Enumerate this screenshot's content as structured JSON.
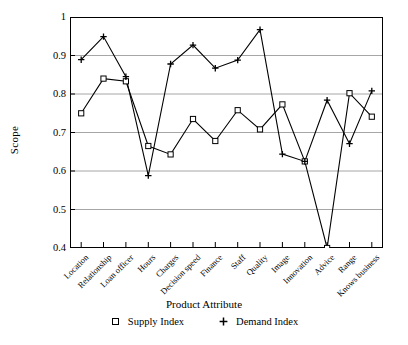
{
  "chart_data": {
    "type": "line",
    "title": "",
    "xlabel": "Product Attribute",
    "ylabel": "Scope",
    "categories": [
      "Location",
      "Relationship",
      "Loan officer",
      "Hours",
      "Charges",
      "Decision speed",
      "Finance",
      "Staff",
      "Quality",
      "Image",
      "Innovation",
      "Advice",
      "Range",
      "Knows business"
    ],
    "series": [
      {
        "name": "Supply Index",
        "marker": "open-square",
        "values": [
          0.75,
          0.84,
          0.833,
          0.665,
          0.643,
          0.735,
          0.678,
          0.758,
          0.708,
          0.773,
          0.625,
          0.4,
          0.802,
          0.741
        ]
      },
      {
        "name": "Demand Index",
        "marker": "plus",
        "values": [
          0.889,
          0.949,
          0.845,
          0.588,
          0.878,
          0.927,
          0.867,
          0.888,
          0.967,
          0.644,
          0.625,
          0.784,
          0.671,
          0.808
        ]
      }
    ],
    "ylim": [
      0.4,
      1.0
    ],
    "yticks": [
      "0.4",
      "0.5",
      "0.6",
      "0.7",
      "0.8",
      "0.9",
      "1"
    ],
    "ytick_values": [
      0.4,
      0.5,
      0.6,
      0.7,
      0.8,
      0.9,
      1.0
    ],
    "grid": "horizontal",
    "legend_position": "bottom",
    "line_color": "#000000",
    "grid_color": "#a6a6a6",
    "axis_color": "#000000"
  },
  "legend": {
    "entries": [
      {
        "label": "Supply Index",
        "marker": "open-square-marker"
      },
      {
        "label": "Demand Index",
        "marker": "plus-marker"
      }
    ]
  }
}
